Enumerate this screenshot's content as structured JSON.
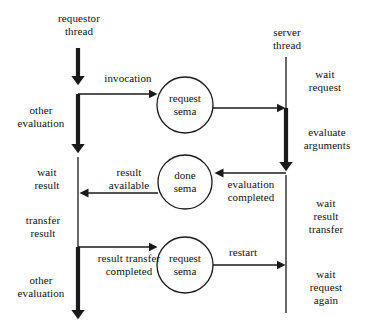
{
  "diagram": {
    "background": "#ffffff",
    "line_color": "#1a1a1a",
    "text_color": "#111111",
    "lanes": [
      {
        "id": "requestor",
        "header": "requestor\nthread",
        "x": 78
      },
      {
        "id": "server",
        "header": "server\nthread",
        "x": 286
      }
    ],
    "nodes": [
      {
        "id": "request-sema-1",
        "label": "request\nsema",
        "cx": 185,
        "cy": 105,
        "r": 28
      },
      {
        "id": "done-sema",
        "label": "done\nsema",
        "cx": 185,
        "cy": 182,
        "r": 27
      },
      {
        "id": "request-sema-2",
        "label": "request\nsema",
        "cx": 185,
        "cy": 265,
        "r": 28
      }
    ],
    "lane_labels": [
      {
        "id": "other-evaluation-1",
        "text": "other\nevaluation",
        "x": 10,
        "y": 104,
        "w": 62
      },
      {
        "id": "wait-result",
        "text": "wait\nresult",
        "x": 22,
        "y": 166,
        "w": 50
      },
      {
        "id": "transfer-result",
        "text": "transfer\nresult",
        "x": 14,
        "y": 214,
        "w": 58
      },
      {
        "id": "other-evaluation-2",
        "text": "other\nevaluation",
        "x": 10,
        "y": 274,
        "w": 62
      },
      {
        "id": "wait-request",
        "text": "wait\nrequest",
        "x": 296,
        "y": 68,
        "w": 58
      },
      {
        "id": "evaluate-arguments",
        "text": "evaluate\narguments",
        "x": 293,
        "y": 126,
        "w": 68
      },
      {
        "id": "wait-result-transfer",
        "text": "wait\nresult\ntransfer",
        "x": 294,
        "y": 197,
        "w": 64
      },
      {
        "id": "wait-request-again",
        "text": "wait\nrequest\nagain",
        "x": 294,
        "y": 268,
        "w": 64
      }
    ],
    "edge_labels": [
      {
        "id": "invocation",
        "text": "invocation",
        "x": 96,
        "y": 72,
        "w": 64
      },
      {
        "id": "result-available",
        "text": "result\navailable",
        "x": 96,
        "y": 166,
        "w": 66
      },
      {
        "id": "evaluation-completed",
        "text": "evaluation\ncompleted",
        "x": 216,
        "y": 178,
        "w": 70
      },
      {
        "id": "result-transfer-completed",
        "text": "result transfer\ncompleted",
        "x": 84,
        "y": 252,
        "w": 90
      },
      {
        "id": "restart",
        "text": "restart",
        "x": 220,
        "y": 246,
        "w": 46
      }
    ]
  }
}
